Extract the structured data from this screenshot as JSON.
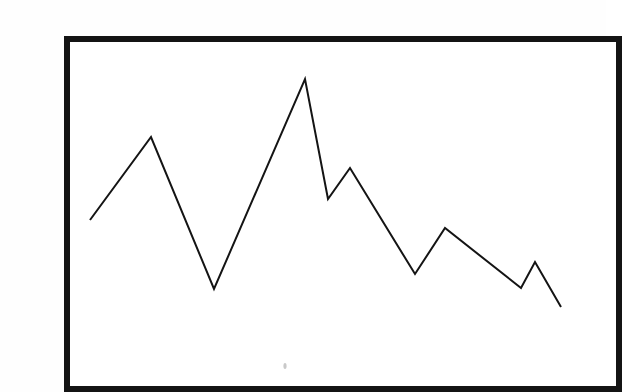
{
  "page": {
    "background_color": "#fefefe",
    "width": 606,
    "height": 392
  },
  "figure": {
    "frame": {
      "stroke_color": "#141414",
      "fill_color": "#ffffff",
      "stroke_width": 6,
      "x": 27,
      "y": 23,
      "width": 552,
      "height": 350
    },
    "artifact": {
      "label": "scan-speck",
      "x": 245,
      "y": 350,
      "r": 2.2,
      "color": "#c9c9c9"
    }
  },
  "chart_data": {
    "type": "line",
    "title": "",
    "subtitle": "",
    "xlabel": "",
    "ylabel": "",
    "grid": false,
    "legend": false,
    "legend_position": "none",
    "axis_visible": false,
    "tick_labels_x": [],
    "tick_labels_y": [],
    "xlim": [
      0,
      10
    ],
    "ylim": [
      0,
      100
    ],
    "line_color": "#141414",
    "line_width": 2,
    "marker": "none",
    "series": [
      {
        "name": "series-1",
        "x": [
          0,
          1,
          2,
          3,
          4,
          5,
          6,
          7,
          8,
          9,
          10
        ],
        "values": [
          48,
          75,
          26,
          94,
          56,
          66,
          32,
          47,
          29,
          37,
          24
        ],
        "pixel_points": [
          {
            "x": 50,
            "y": 204
          },
          {
            "x": 111,
            "y": 121
          },
          {
            "x": 174,
            "y": 273
          },
          {
            "x": 265,
            "y": 63
          },
          {
            "x": 288,
            "y": 183
          },
          {
            "x": 310,
            "y": 152
          },
          {
            "x": 375,
            "y": 258
          },
          {
            "x": 405,
            "y": 212
          },
          {
            "x": 481,
            "y": 272
          },
          {
            "x": 495,
            "y": 246
          },
          {
            "x": 521,
            "y": 291
          }
        ]
      }
    ],
    "annotations": []
  },
  "accessibility": {
    "figure_description": "Hand-drawn zig-zag line chart inside a thick black rectangular border on a white page."
  }
}
